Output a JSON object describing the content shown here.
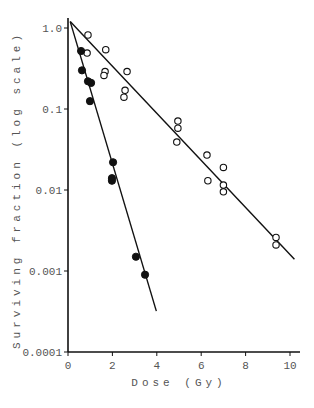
{
  "chart_data": {
    "type": "scatter",
    "title": "",
    "xlabel": "Dose (Gy)",
    "ylabel": "Surviving fraction (log scale)",
    "xlim": [
      0,
      10
    ],
    "ylim": [
      0.0001,
      1.2
    ],
    "yscale": "log",
    "grid": false,
    "legend": null,
    "x_ticks": [
      0,
      2,
      4,
      6,
      8,
      10
    ],
    "x_tick_labels": [
      "0",
      "2",
      "4",
      "6",
      "8",
      "10"
    ],
    "y_ticks": [
      1.0,
      0.1,
      0.01,
      0.001,
      0.0001
    ],
    "y_tick_labels": [
      "1.0",
      "0.1",
      "0.01",
      "0.001",
      "0.0001"
    ],
    "series": [
      {
        "name": "open circles",
        "marker": "open-circle",
        "points": [
          [
            0.9,
            0.82
          ],
          [
            0.86,
            0.49
          ],
          [
            1.7,
            0.54
          ],
          [
            1.67,
            0.29
          ],
          [
            1.62,
            0.26
          ],
          [
            2.66,
            0.29
          ],
          [
            2.57,
            0.17
          ],
          [
            2.52,
            0.14
          ],
          [
            4.95,
            0.071
          ],
          [
            4.95,
            0.058
          ],
          [
            4.9,
            0.039
          ],
          [
            6.26,
            0.027
          ],
          [
            6.3,
            0.013
          ],
          [
            7.0,
            0.019
          ],
          [
            7.0,
            0.0115
          ],
          [
            7.0,
            0.0095
          ],
          [
            9.37,
            0.0026
          ],
          [
            9.37,
            0.0021
          ]
        ],
        "fit_line": [
          [
            0.1,
            1.2
          ],
          [
            10.2,
            0.0014
          ]
        ]
      },
      {
        "name": "filled circles",
        "marker": "filled-circle",
        "points": [
          [
            0.59,
            0.52
          ],
          [
            0.63,
            0.3
          ],
          [
            0.9,
            0.22
          ],
          [
            1.04,
            0.21
          ],
          [
            0.99,
            0.125
          ],
          [
            2.03,
            0.022
          ],
          [
            1.98,
            0.014
          ],
          [
            1.98,
            0.013
          ],
          [
            3.06,
            0.0015
          ],
          [
            3.47,
            0.0009
          ]
        ],
        "fit_line": [
          [
            0.1,
            1.2
          ],
          [
            3.98,
            0.00032
          ]
        ]
      }
    ]
  }
}
